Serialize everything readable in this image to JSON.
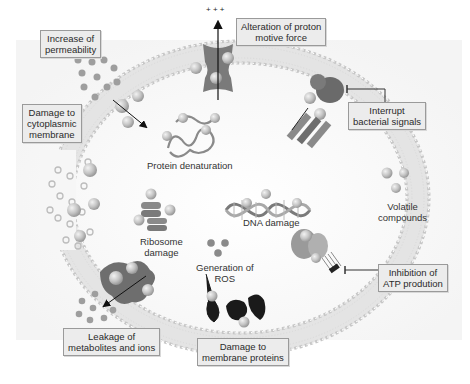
{
  "diagram": {
    "colors": {
      "membrane_head": "#c8c8c8",
      "membrane_tail": "#e2e2e2",
      "protein_dark": "#6e6e6e",
      "protein_mid": "#8c8c8c",
      "sphere": "#bdbdbd",
      "label_bg": "#ececec",
      "label_border": "#9a9a9a",
      "text": "#2a2a2a"
    },
    "boxed_labels": {
      "permeability": [
        "Increase of",
        "permeability"
      ],
      "cytoplasmic": [
        "Damage to",
        "cytoplasmic",
        "membrane"
      ],
      "proton": [
        "Alteration of proton",
        "motive force"
      ],
      "signals": [
        "Interrupt",
        "bacterial signals"
      ],
      "atp": [
        "Inhibition of",
        "ATP prodution"
      ],
      "leakage": [
        "Leakage of",
        "metabolites and ions"
      ],
      "membrane_proteins": [
        "Damage to",
        "membrane proteins"
      ]
    },
    "inner_labels": {
      "protein": [
        "Protein denaturation"
      ],
      "dna": [
        "DNA damage"
      ],
      "ribosome": [
        "Ribosome",
        "damage"
      ],
      "ros": [
        "Generation of",
        "ROS"
      ],
      "volatile": [
        "Volatile",
        "compounds"
      ]
    },
    "charge_symbols": "+ + +",
    "icons": [
      "proton-channel-icon",
      "signal-receptor-icon",
      "atp-synthase-icon",
      "porin-icon",
      "protein-coil-icon",
      "dna-helix-icon",
      "ribosome-icon",
      "ros-molecules-icon",
      "volatile-compounds-icon",
      "inhibition-bar-icon",
      "arrow-icon"
    ]
  }
}
